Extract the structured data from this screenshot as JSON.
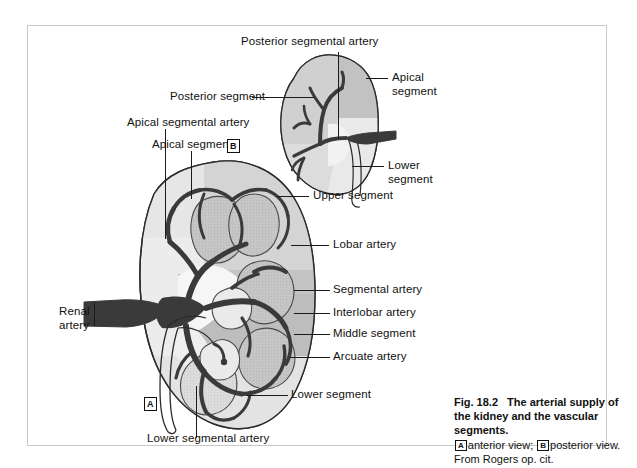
{
  "figure": {
    "number": "Fig. 18.2",
    "title": "The arterial supply of the kidney and the vascular segments.",
    "caption_a_marker": "A",
    "caption_a_text": "anterior view;",
    "caption_b_marker": "B",
    "caption_b_text": "posterior view. From Rogers op. cit.",
    "panel_a_marker": "A",
    "panel_b_marker": "B"
  },
  "labels": {
    "posterior_segmental_artery": "Posterior segmental artery",
    "posterior_segment": "Posterior segment",
    "apical_segment_b_line1": "Apical",
    "apical_segment_b_line2": "segment",
    "lower_segment_b_line1": "Lower",
    "lower_segment_b_line2": "segment",
    "apical_segmental_artery": "Apical segmental artery",
    "apical_segment_a": "Apical segment",
    "upper_segment": "Upper segment",
    "lobar_artery": "Lobar artery",
    "segmental_artery": "Segmental artery",
    "interlobar_artery": "Interlobar artery",
    "middle_segment": "Middle segment",
    "arcuate_artery": "Arcuate artery",
    "renal_artery_line1": "Renal",
    "renal_artery_line2": "artery",
    "lower_segment_a": "Lower segment",
    "lower_segmental_artery": "Lower segmental artery"
  },
  "colors": {
    "frame_border": "#c9c9c9",
    "page_background": "#ffffff",
    "artery_dark": "#3a3a3a",
    "segment_light": "#eaeaea",
    "segment_mid": "#d2d2d2",
    "segment_dark": "#b9b9b9",
    "pyramid_fill": "#c6c6c6",
    "outline": "#2b2b2b",
    "text": "#111111",
    "leader_line": "#1b1b1b"
  }
}
